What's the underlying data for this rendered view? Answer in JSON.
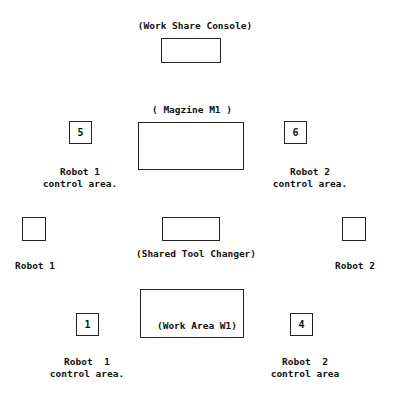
{
  "diagram": {
    "console": {
      "label": "(Work Share Console)"
    },
    "magazine": {
      "label": "( Magzine M1 )"
    },
    "tool_changer": {
      "label": "(Shared Tool Changer)"
    },
    "work_area": {
      "label": "(Work Area W1)"
    },
    "markers": {
      "m5": "5",
      "m6": "6",
      "m1": "1",
      "m4": "4"
    },
    "labels": {
      "robot1_ctrl_top_l1": "Robot 1",
      "robot1_ctrl_top_l2": "control area.",
      "robot2_ctrl_top_l1": "Robot 2",
      "robot2_ctrl_top_l2": "control area.",
      "robot1": "Robot 1",
      "robot2": "Robot 2",
      "robot1_ctrl_bot_l1": "Robot  1",
      "robot1_ctrl_bot_l2": "control area.",
      "robot2_ctrl_bot_l1": "Robot  2",
      "robot2_ctrl_bot_l2": "control area"
    }
  }
}
